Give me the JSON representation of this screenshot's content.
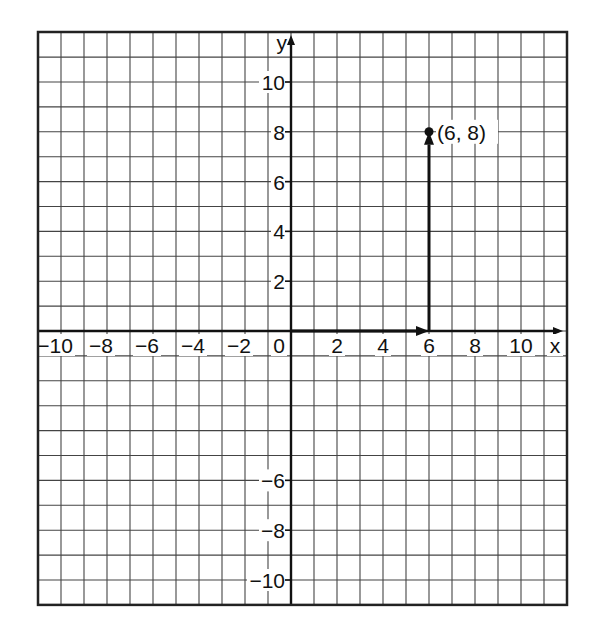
{
  "chart_data": {
    "type": "scatter",
    "title": "",
    "xlabel": "x",
    "ylabel": "y",
    "xlim": [
      -11,
      12
    ],
    "ylim": [
      -11,
      12
    ],
    "grid": true,
    "x_tick_labels": [
      "−10",
      "−8",
      "−6",
      "−4",
      "−2",
      "0",
      "2",
      "4",
      "6",
      "8",
      "10"
    ],
    "x_ticks": [
      -10,
      -8,
      -6,
      -4,
      -2,
      0,
      2,
      4,
      6,
      8,
      10
    ],
    "y_tick_labels": [
      "10",
      "8",
      "6",
      "4",
      "2",
      "−6",
      "−8",
      "−10"
    ],
    "y_ticks": [
      10,
      8,
      6,
      4,
      2,
      -6,
      -8,
      -10
    ],
    "points": [
      {
        "x": 6,
        "y": 8,
        "label": "(6, 8)"
      }
    ],
    "vectors": [
      {
        "from": [
          0,
          0
        ],
        "to": [
          6,
          0
        ],
        "label": "horizontal move 6 units right"
      },
      {
        "from": [
          6,
          0
        ],
        "to": [
          6,
          8
        ],
        "label": "vertical move 8 units up"
      }
    ]
  },
  "labels": {
    "x_axis": "x",
    "y_axis": "y",
    "origin": "0",
    "point": "(6, 8)"
  },
  "colors": {
    "grid": "#444444",
    "axis": "#111111",
    "background": "#ffffff"
  }
}
